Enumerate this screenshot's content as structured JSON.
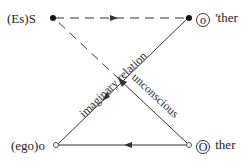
{
  "diagram": {
    "nodes": {
      "subject": {
        "label": "(Es)S"
      },
      "other_small": {
        "circled": "o",
        "suffix": " 'ther"
      },
      "ego": {
        "label": "(ego)o"
      },
      "other_big": {
        "circled": "O",
        "suffix": " ther"
      }
    },
    "edges": {
      "imaginary": {
        "label": "imaginary relation"
      },
      "unconscious": {
        "label": "unconscious"
      }
    },
    "colors": {
      "line": "#333333"
    }
  }
}
